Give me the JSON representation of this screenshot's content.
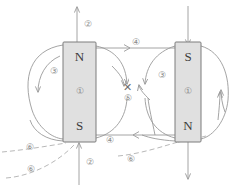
{
  "diagram": {
    "colors": {
      "magnet_fill": "#e0e0e0",
      "magnet_stroke": "#7d7d7d",
      "field_line": "#9a9a9a",
      "dashed_line": "#b0b0b0",
      "label_text": "#8a8a8a",
      "pole_text": "#3c3c3c",
      "background": "#ffffff"
    },
    "magnets": [
      {
        "name": "left-magnet",
        "top_pole": "N",
        "bottom_pole": "S",
        "center_label": "①",
        "x": 63,
        "y": 42,
        "width": 33,
        "height": 100
      },
      {
        "name": "right-magnet",
        "top_pole": "S",
        "bottom_pole": "N",
        "center_label": "①",
        "x": 175,
        "y": 42,
        "width": 26,
        "height": 100
      }
    ],
    "callouts": [
      {
        "id": "c1",
        "label": "②",
        "x": 88,
        "y": 25
      },
      {
        "id": "c2",
        "label": "③",
        "x": 54,
        "y": 72
      },
      {
        "id": "c3",
        "label": "④",
        "x": 136,
        "y": 43
      },
      {
        "id": "c4",
        "label": "③",
        "x": 162,
        "y": 76
      },
      {
        "id": "c5",
        "label": "⑤",
        "x": 128,
        "y": 99
      },
      {
        "id": "c6",
        "label": "④",
        "x": 110,
        "y": 141
      },
      {
        "id": "c7",
        "label": "⑥",
        "x": 30,
        "y": 148
      },
      {
        "id": "c8",
        "label": "⑥",
        "x": 31,
        "y": 170
      },
      {
        "id": "c9",
        "label": "⑥",
        "x": 131,
        "y": 160
      },
      {
        "id": "c10",
        "label": "②",
        "x": 90,
        "y": 163
      }
    ],
    "center_cross": {
      "label": "✕",
      "x": 127,
      "y": 88
    },
    "arrows": {
      "top_vertical": {
        "name": "top-up-arrow",
        "direction": "up"
      },
      "right_top_vertical": {
        "name": "right-down-arrow",
        "direction": "down"
      },
      "bottom_left_vertical": {
        "name": "bottom-up-arrow",
        "direction": "up"
      },
      "bottom_right_vertical": {
        "name": "bottom-down-arrow",
        "direction": "down"
      },
      "upper_horizontal": {
        "name": "upper-right-arrow",
        "direction": "right"
      },
      "lower_horizontal": {
        "name": "lower-left-arrow",
        "direction": "left"
      }
    }
  }
}
